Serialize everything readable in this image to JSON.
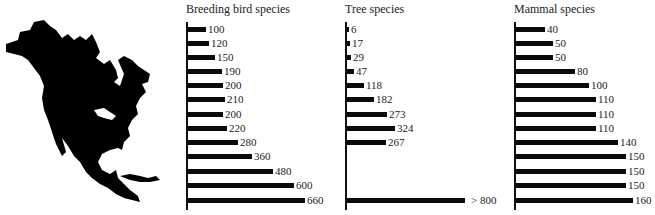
{
  "figure": {
    "map_label": "North America silhouette"
  },
  "chart_data": [
    {
      "type": "bar",
      "orientation": "horizontal",
      "title": "Breeding bird species",
      "categories": [
        "1",
        "2",
        "3",
        "4",
        "5",
        "6",
        "7",
        "8",
        "9",
        "10",
        "11",
        "12",
        "13"
      ],
      "values": [
        100,
        120,
        150,
        190,
        200,
        210,
        200,
        220,
        280,
        360,
        480,
        600,
        660
      ],
      "labels": [
        "100",
        "120",
        "150",
        "190",
        "200",
        "210",
        "200",
        "220",
        "280",
        "360",
        "480",
        "600",
        "660"
      ],
      "xlabel": "",
      "ylabel": "",
      "grid": false,
      "xlim": [
        0,
        660
      ]
    },
    {
      "type": "bar",
      "orientation": "horizontal",
      "title": "Tree species",
      "categories": [
        "1",
        "2",
        "3",
        "4",
        "5",
        "6",
        "7",
        "8",
        "9",
        "10",
        "11",
        "12",
        "13"
      ],
      "values": [
        6,
        17,
        29,
        47,
        118,
        182,
        273,
        324,
        267,
        null,
        null,
        null,
        800
      ],
      "labels": [
        "6",
        "17",
        "29",
        "47",
        "118",
        "182",
        "273",
        "324",
        "267",
        "",
        "",
        "",
        "> 800"
      ],
      "xlabel": "",
      "ylabel": "",
      "grid": false,
      "xlim": [
        0,
        800
      ]
    },
    {
      "type": "bar",
      "orientation": "horizontal",
      "title": "Mammal species",
      "categories": [
        "1",
        "2",
        "3",
        "4",
        "5",
        "6",
        "7",
        "8",
        "9",
        "10",
        "11",
        "12",
        "13"
      ],
      "values": [
        40,
        50,
        50,
        80,
        100,
        110,
        110,
        110,
        140,
        150,
        150,
        150,
        160
      ],
      "labels": [
        "40",
        "50",
        "50",
        "80",
        "100",
        "110",
        "110",
        "110",
        "140",
        "150",
        "150",
        "150",
        "160"
      ],
      "xlabel": "",
      "ylabel": "",
      "grid": false,
      "xlim": [
        0,
        160
      ]
    }
  ],
  "panels": [
    {
      "title": "Breeding bird species"
    },
    {
      "title": "Tree species"
    },
    {
      "title": "Mammal species"
    }
  ]
}
